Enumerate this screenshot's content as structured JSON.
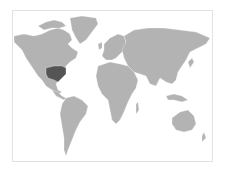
{
  "map": {
    "type": "world-choropleth",
    "projection": "mercator",
    "colors": {
      "background": "#ffffff",
      "frame_border": "#e2e2e2",
      "land": "#b3b3b3",
      "highlight": "#555555"
    },
    "highlighted_regions": [
      {
        "name": "Central-Eastern United States",
        "color": "#555555"
      }
    ],
    "regions": [
      "North America",
      "Greenland",
      "South America",
      "Europe",
      "Africa",
      "Asia",
      "Australia",
      "Antarctic islands"
    ]
  }
}
